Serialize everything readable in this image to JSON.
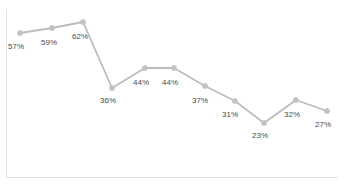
{
  "chart_data": {
    "type": "line",
    "title": "",
    "subtitle": "",
    "xlabel": "",
    "ylabel": "",
    "grid": false,
    "legend": false,
    "legend_position": "none",
    "axis_lines": [
      "left",
      "bottom"
    ],
    "tick_labels": {
      "x": [],
      "y": []
    },
    "ylim": [
      0,
      70
    ],
    "xlim": [
      0,
      10
    ],
    "line_color": "#bcbcbc",
    "marker_color": "#c2c2c2",
    "label_color": "#4a4a4a",
    "axis_color": "#e2e2e2",
    "categories": [
      "1",
      "2",
      "3",
      "4",
      "5",
      "6",
      "7",
      "8",
      "9",
      "10",
      "11"
    ],
    "values": [
      57,
      59,
      62,
      36,
      44,
      44,
      37,
      31,
      23,
      32,
      27
    ],
    "data_labels": [
      "57%",
      "59%",
      "62%",
      "36%",
      "44%",
      "44%",
      "37%",
      "31%",
      "23%",
      "32%",
      "27%"
    ],
    "points": [
      {
        "index": 0,
        "value": 57,
        "label": "57%",
        "px": 20,
        "py": 33,
        "label_x": 8,
        "label_y": 42
      },
      {
        "index": 1,
        "value": 59,
        "label": "59%",
        "px": 52,
        "py": 28,
        "label_x": 41,
        "label_y": 38
      },
      {
        "index": 2,
        "value": 62,
        "label": "62%",
        "px": 83,
        "py": 22,
        "label_x": 72,
        "label_y": 32
      },
      {
        "index": 3,
        "value": 36,
        "label": "36%",
        "px": 112,
        "py": 88,
        "label_x": 100,
        "label_y": 96
      },
      {
        "index": 4,
        "value": 44,
        "label": "44%",
        "px": 145,
        "py": 68,
        "label_x": 133,
        "label_y": 78
      },
      {
        "index": 5,
        "value": 44,
        "label": "44%",
        "px": 174,
        "py": 68,
        "label_x": 162,
        "label_y": 78
      },
      {
        "index": 6,
        "value": 37,
        "label": "37%",
        "px": 205,
        "py": 86,
        "label_x": 192,
        "label_y": 96
      },
      {
        "index": 7,
        "value": 31,
        "label": "31%",
        "px": 235,
        "py": 101,
        "label_x": 222,
        "label_y": 110
      },
      {
        "index": 8,
        "value": 23,
        "label": "23%",
        "px": 264,
        "py": 123,
        "label_x": 252,
        "label_y": 131
      },
      {
        "index": 9,
        "value": 32,
        "label": "32%",
        "px": 296,
        "py": 100,
        "label_x": 284,
        "label_y": 110
      },
      {
        "index": 10,
        "value": 27,
        "label": "27%",
        "px": 327,
        "py": 111,
        "label_x": 315,
        "label_y": 120
      }
    ]
  }
}
